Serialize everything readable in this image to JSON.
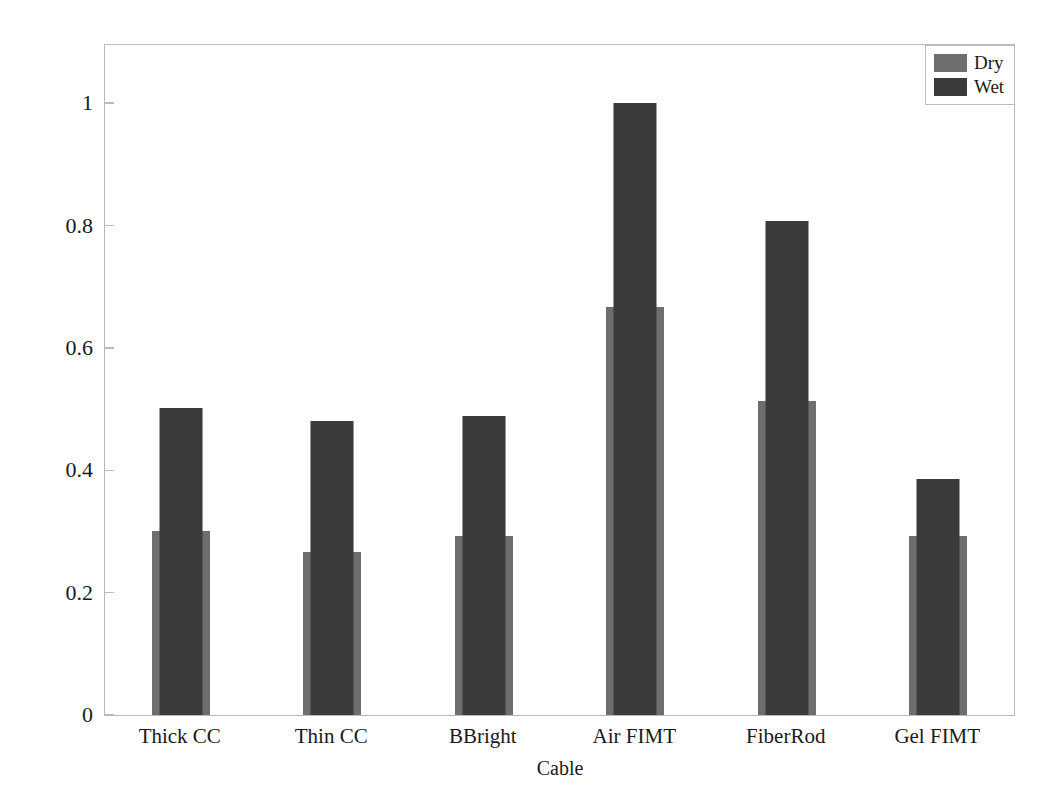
{
  "chart_data": {
    "type": "bar",
    "title": "",
    "subtitle": "",
    "xlabel": "Cable",
    "ylabel": "Scaled amplitude",
    "categories": [
      "Thick CC",
      "Thin CC",
      "BBright",
      "Air FIMT",
      "FiberRod",
      "Gel FIMT"
    ],
    "series": [
      {
        "name": "Dry",
        "color": "#6e6e6e",
        "values": [
          0.3,
          0.267,
          0.293,
          0.667,
          0.513,
          0.293
        ]
      },
      {
        "name": "Wet",
        "color": "#3a3a3a",
        "values": [
          0.501,
          0.481,
          0.489,
          1.0,
          0.808,
          0.386
        ]
      }
    ],
    "ylim": [
      0,
      1.095
    ],
    "yticks": [
      0,
      0.2,
      0.4,
      0.6,
      0.8,
      1
    ],
    "ytick_labels": [
      "0",
      "0.2",
      "0.4",
      "0.6",
      "0.8",
      "1"
    ],
    "grid": false,
    "legend_position": "upper right",
    "bar_style": "overlaid",
    "bar_width_dry_px": 58,
    "bar_width_wet_px": 43,
    "annotations": []
  },
  "legend": {
    "entries": [
      {
        "label": "Dry",
        "color": "#6e6e6e"
      },
      {
        "label": "Wet",
        "color": "#3a3a3a"
      }
    ]
  },
  "axes": {
    "frame_color": "#b9b9b9",
    "background": "#ffffff"
  }
}
